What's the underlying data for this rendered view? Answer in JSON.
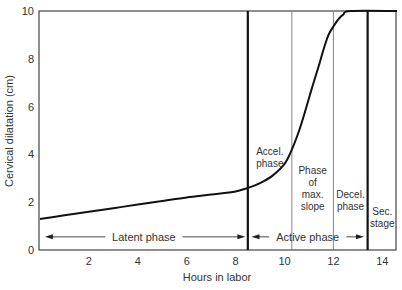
{
  "chart_data": {
    "type": "line",
    "title": "",
    "xlabel": "Hours in labor",
    "ylabel": "Cervical dilatation (cm)",
    "xlim": [
      0,
      14.6
    ],
    "ylim": [
      0,
      10
    ],
    "xticks": [
      2,
      4,
      6,
      8,
      10,
      12,
      14
    ],
    "yticks": [
      0,
      2,
      4,
      6,
      8,
      10
    ],
    "grid": false,
    "legend": null,
    "series": [
      {
        "name": "Cervical dilatation",
        "x": [
          0,
          1,
          2,
          3,
          4,
          5,
          6,
          7,
          8,
          8.5,
          9.0,
          9.5,
          10.0,
          10.3,
          10.6,
          10.8,
          11.1,
          11.4,
          11.6,
          11.8,
          12.0,
          12.2,
          12.4,
          12.7,
          14.6
        ],
        "y": [
          1.3,
          1.45,
          1.6,
          1.75,
          1.9,
          2.05,
          2.2,
          2.32,
          2.45,
          2.6,
          2.8,
          3.1,
          3.6,
          4.2,
          5.0,
          5.65,
          6.7,
          7.7,
          8.4,
          9.0,
          9.35,
          9.65,
          9.85,
          10.0,
          10.0
        ]
      }
    ],
    "vertical_lines": [
      {
        "x": 8.5,
        "weight": "thick"
      },
      {
        "x": 10.3,
        "weight": "thin"
      },
      {
        "x": 12.0,
        "weight": "thin"
      },
      {
        "x": 13.4,
        "weight": "thick"
      }
    ],
    "annotations": [
      {
        "text": [
          "Accel.",
          "phase"
        ],
        "x": 9.4,
        "y": 3.9
      },
      {
        "text": [
          "Phase",
          "of",
          "max.",
          "slope"
        ],
        "x": 11.15,
        "y": 2.6
      },
      {
        "text": [
          "Decel.",
          "phase"
        ],
        "x": 12.7,
        "y": 2.1
      },
      {
        "text": [
          "Sec.",
          "stage"
        ],
        "x": 14.0,
        "y": 1.4
      },
      {
        "text": [
          "Latent phase"
        ],
        "x": 4.25,
        "y": 0.55,
        "arrow_from": 0.2,
        "arrow_to": 8.4
      },
      {
        "text": [
          "Active phase"
        ],
        "x": 10.95,
        "y": 0.55,
        "arrow_from": 8.65,
        "arrow_to": 13.25
      }
    ]
  }
}
